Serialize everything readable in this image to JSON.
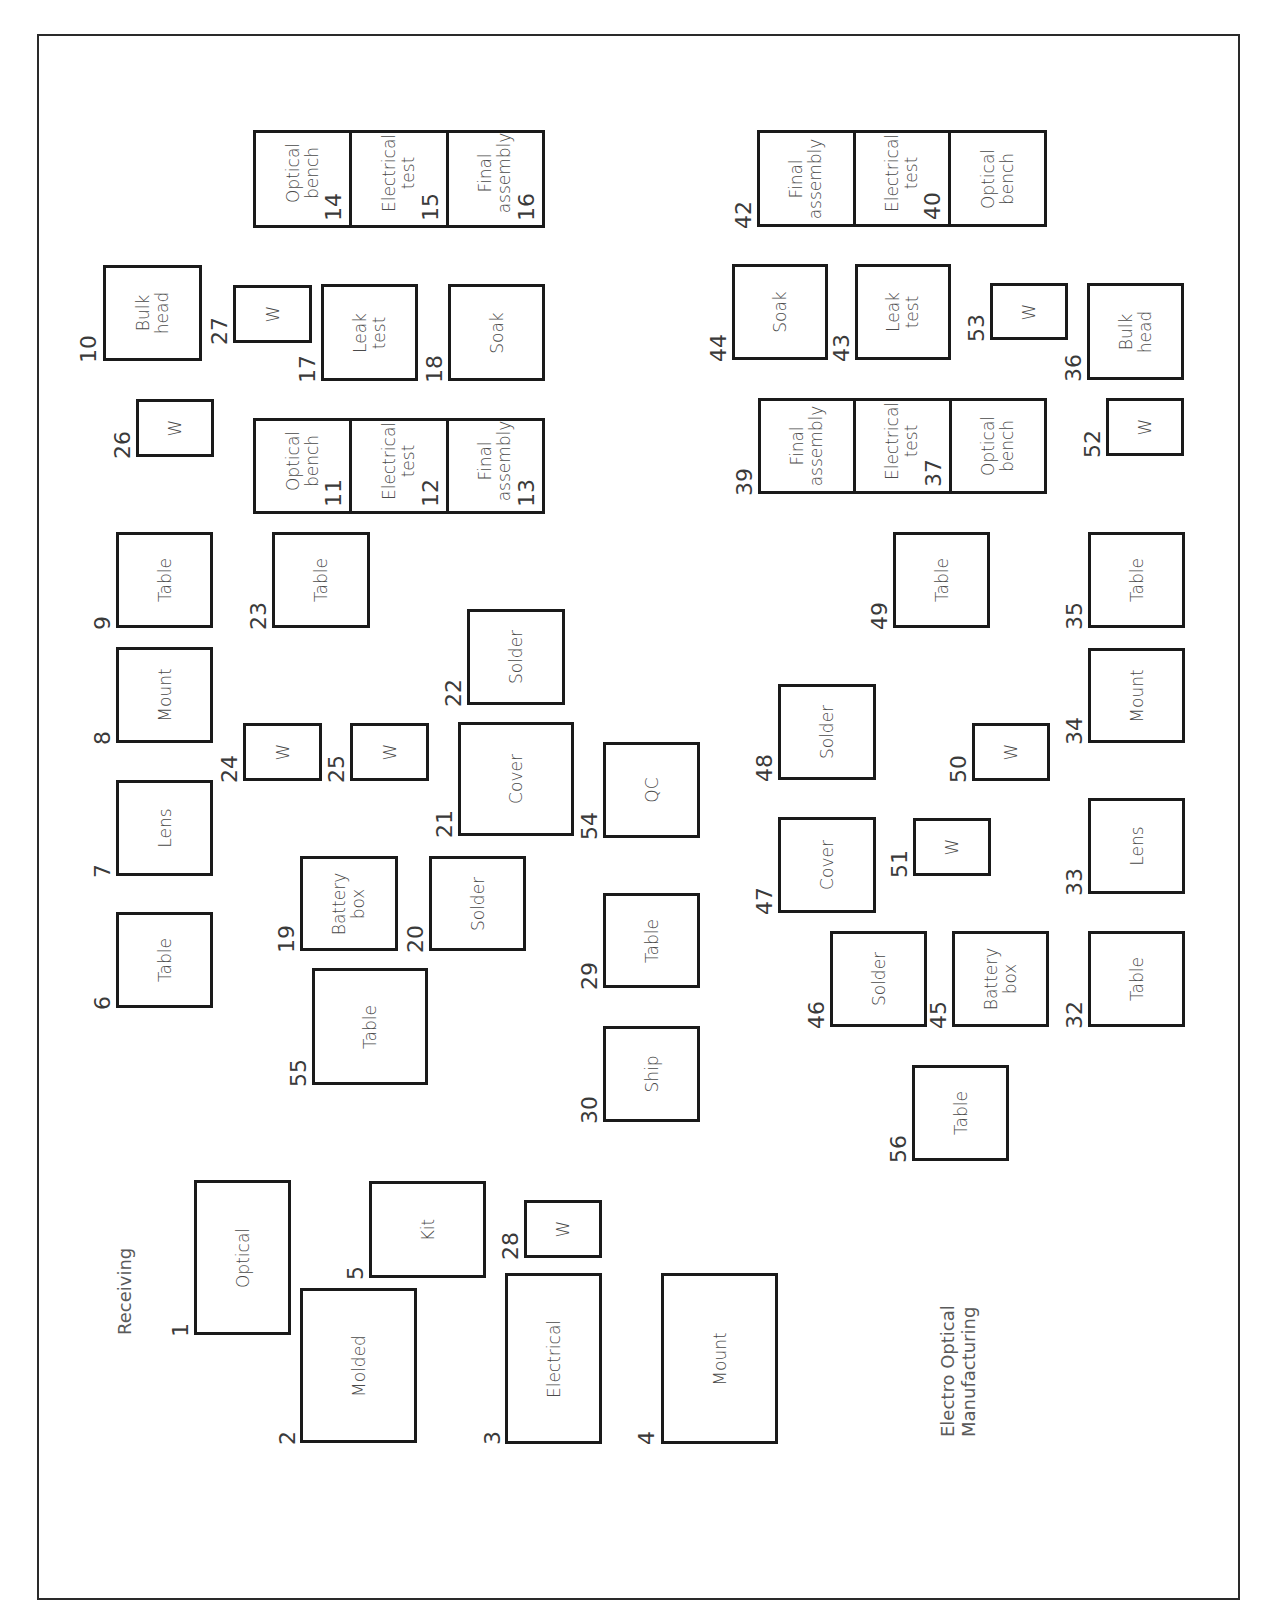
{
  "diagram": {
    "title": "Electro Optical\nManufacturing",
    "area_label": "Receiving",
    "orientation": "rotated -90deg (landscape plan printed in portrait)",
    "colors": {
      "line": "#1a1a1a",
      "text": "#4a4a4a",
      "background": "#ffffff"
    }
  },
  "stations": [
    {
      "id": "1",
      "label": "Optical",
      "x": 194,
      "y": 1180,
      "w": 97,
      "h": 155,
      "num_x": 170,
      "num_y": 1337
    },
    {
      "id": "2",
      "label": "Molded",
      "x": 300,
      "y": 1288,
      "w": 117,
      "h": 155,
      "num_x": 277,
      "num_y": 1445
    },
    {
      "id": "3",
      "label": "Electrical",
      "x": 505,
      "y": 1273,
      "w": 97,
      "h": 171,
      "num_x": 482,
      "num_y": 1445
    },
    {
      "id": "4",
      "label": "Mount",
      "x": 661,
      "y": 1273,
      "w": 117,
      "h": 171,
      "num_x": 636,
      "num_y": 1445
    },
    {
      "id": "5",
      "label": "Kit",
      "x": 369,
      "y": 1181,
      "w": 117,
      "h": 97,
      "num_x": 345,
      "num_y": 1280
    },
    {
      "id": "6",
      "label": "Table",
      "x": 116,
      "y": 912,
      "w": 97,
      "h": 96,
      "num_x": 92,
      "num_y": 1010
    },
    {
      "id": "7",
      "label": "Lens",
      "x": 116,
      "y": 780,
      "w": 97,
      "h": 96,
      "num_x": 92,
      "num_y": 878
    },
    {
      "id": "8",
      "label": "Mount",
      "x": 116,
      "y": 647,
      "w": 97,
      "h": 96,
      "num_x": 92,
      "num_y": 745
    },
    {
      "id": "9",
      "label": "Table",
      "x": 116,
      "y": 532,
      "w": 97,
      "h": 96,
      "num_x": 92,
      "num_y": 630
    },
    {
      "id": "10",
      "label": "Bulk\nhead",
      "x": 103,
      "y": 265,
      "w": 99,
      "h": 96,
      "num_x": 78,
      "num_y": 363
    },
    {
      "id": "17",
      "label": "Leak\ntest",
      "x": 321,
      "y": 284,
      "w": 97,
      "h": 97,
      "num_x": 297,
      "num_y": 383
    },
    {
      "id": "18",
      "label": "Soak",
      "x": 448,
      "y": 284,
      "w": 97,
      "h": 97,
      "num_x": 424,
      "num_y": 383
    },
    {
      "id": "19",
      "label": "Battery\nbox",
      "x": 300,
      "y": 856,
      "w": 98,
      "h": 95,
      "num_x": 276,
      "num_y": 953
    },
    {
      "id": "20",
      "label": "Solder",
      "x": 429,
      "y": 856,
      "w": 97,
      "h": 95,
      "num_x": 405,
      "num_y": 953
    },
    {
      "id": "21",
      "label": "Cover",
      "x": 458,
      "y": 722,
      "w": 116,
      "h": 114,
      "num_x": 434,
      "num_y": 838
    },
    {
      "id": "22",
      "label": "Solder",
      "x": 467,
      "y": 609,
      "w": 98,
      "h": 96,
      "num_x": 443,
      "num_y": 707
    },
    {
      "id": "23",
      "label": "Table",
      "x": 272,
      "y": 532,
      "w": 98,
      "h": 96,
      "num_x": 248,
      "num_y": 630
    },
    {
      "id": "24",
      "label": "W",
      "x": 243,
      "y": 723,
      "w": 79,
      "h": 58,
      "num_x": 219,
      "num_y": 783
    },
    {
      "id": "25",
      "label": "W",
      "x": 350,
      "y": 723,
      "w": 79,
      "h": 58,
      "num_x": 326,
      "num_y": 783
    },
    {
      "id": "26",
      "label": "W",
      "x": 136,
      "y": 399,
      "w": 78,
      "h": 58,
      "num_x": 112,
      "num_y": 459
    },
    {
      "id": "27",
      "label": "W",
      "x": 233,
      "y": 285,
      "w": 79,
      "h": 58,
      "num_x": 209,
      "num_y": 345
    },
    {
      "id": "28",
      "label": "W",
      "x": 524,
      "y": 1200,
      "w": 78,
      "h": 58,
      "num_x": 500,
      "num_y": 1260
    },
    {
      "id": "29",
      "label": "Table",
      "x": 603,
      "y": 893,
      "w": 97,
      "h": 95,
      "num_x": 579,
      "num_y": 990
    },
    {
      "id": "30",
      "label": "Ship",
      "x": 603,
      "y": 1026,
      "w": 97,
      "h": 96,
      "num_x": 579,
      "num_y": 1124
    },
    {
      "id": "32",
      "label": "Table",
      "x": 1088,
      "y": 931,
      "w": 97,
      "h": 96,
      "num_x": 1064,
      "num_y": 1029
    },
    {
      "id": "33",
      "label": "Lens",
      "x": 1088,
      "y": 798,
      "w": 97,
      "h": 96,
      "num_x": 1064,
      "num_y": 896
    },
    {
      "id": "34",
      "label": "Mount",
      "x": 1088,
      "y": 648,
      "w": 97,
      "h": 95,
      "num_x": 1064,
      "num_y": 745
    },
    {
      "id": "35",
      "label": "Table",
      "x": 1088,
      "y": 532,
      "w": 97,
      "h": 96,
      "num_x": 1064,
      "num_y": 630
    },
    {
      "id": "36",
      "label": "Bulk\nhead",
      "x": 1087,
      "y": 283,
      "w": 97,
      "h": 97,
      "num_x": 1063,
      "num_y": 382
    },
    {
      "id": "43",
      "label": "Leak\ntest",
      "x": 855,
      "y": 264,
      "w": 96,
      "h": 96,
      "num_x": 831,
      "num_y": 362
    },
    {
      "id": "44",
      "label": "Soak",
      "x": 732,
      "y": 264,
      "w": 96,
      "h": 96,
      "num_x": 708,
      "num_y": 362
    },
    {
      "id": "45",
      "label": "Battery\nbox",
      "x": 952,
      "y": 931,
      "w": 97,
      "h": 96,
      "num_x": 928,
      "num_y": 1029
    },
    {
      "id": "46",
      "label": "Solder",
      "x": 830,
      "y": 931,
      "w": 97,
      "h": 96,
      "num_x": 806,
      "num_y": 1029
    },
    {
      "id": "47",
      "label": "Cover",
      "x": 778,
      "y": 817,
      "w": 98,
      "h": 96,
      "num_x": 754,
      "num_y": 915
    },
    {
      "id": "48",
      "label": "Solder",
      "x": 778,
      "y": 684,
      "w": 98,
      "h": 96,
      "num_x": 754,
      "num_y": 782
    },
    {
      "id": "49",
      "label": "Table",
      "x": 893,
      "y": 532,
      "w": 97,
      "h": 96,
      "num_x": 869,
      "num_y": 630
    },
    {
      "id": "50",
      "label": "W",
      "x": 972,
      "y": 723,
      "w": 78,
      "h": 58,
      "num_x": 948,
      "num_y": 783
    },
    {
      "id": "51",
      "label": "W",
      "x": 913,
      "y": 818,
      "w": 78,
      "h": 58,
      "num_x": 889,
      "num_y": 878
    },
    {
      "id": "52",
      "label": "W",
      "x": 1106,
      "y": 398,
      "w": 78,
      "h": 58,
      "num_x": 1082,
      "num_y": 458
    },
    {
      "id": "53",
      "label": "W",
      "x": 990,
      "y": 283,
      "w": 78,
      "h": 57,
      "num_x": 966,
      "num_y": 342
    },
    {
      "id": "54",
      "label": "QC",
      "x": 603,
      "y": 742,
      "w": 97,
      "h": 96,
      "num_x": 579,
      "num_y": 840
    },
    {
      "id": "55",
      "label": "Table",
      "x": 312,
      "y": 968,
      "w": 116,
      "h": 117,
      "num_x": 288,
      "num_y": 1087
    },
    {
      "id": "56",
      "label": "Table",
      "x": 912,
      "y": 1065,
      "w": 97,
      "h": 96,
      "num_x": 888,
      "num_y": 1163
    }
  ],
  "bench_groups": [
    {
      "name": "group-14-16",
      "x": 253,
      "y": 130,
      "w": 292,
      "h": 98,
      "cells": [
        {
          "id": "14",
          "label": "Optical\nbench"
        },
        {
          "id": "15",
          "label": "Electrical\ntest"
        },
        {
          "id": "16",
          "label": "Final\nassembly"
        }
      ]
    },
    {
      "name": "group-11-13",
      "x": 253,
      "y": 418,
      "w": 292,
      "h": 96,
      "cells": [
        {
          "id": "11",
          "label": "Optical\nbench"
        },
        {
          "id": "12",
          "label": "Electrical\ntest"
        },
        {
          "id": "13",
          "label": "Final\nassembly"
        }
      ]
    },
    {
      "name": "group-42-40",
      "x": 757,
      "y": 130,
      "w": 290,
      "h": 97,
      "num_left": "42",
      "cells": [
        {
          "id": "",
          "label": "Final\nassembly"
        },
        {
          "id": "40",
          "label": "Electrical\ntest"
        },
        {
          "id": "",
          "label": "Optical\nbench"
        }
      ]
    },
    {
      "name": "group-39-37",
      "x": 758,
      "y": 398,
      "w": 289,
      "h": 96,
      "num_left": "39",
      "cells": [
        {
          "id": "",
          "label": "Final\nassembly"
        },
        {
          "id": "37",
          "label": "Electrical\ntest"
        },
        {
          "id": "",
          "label": "Optical\nbench"
        }
      ]
    }
  ],
  "free_labels": [
    {
      "key": "area_label",
      "x": 115,
      "y": 1335
    },
    {
      "key": "title",
      "x": 938,
      "y": 1437
    }
  ]
}
